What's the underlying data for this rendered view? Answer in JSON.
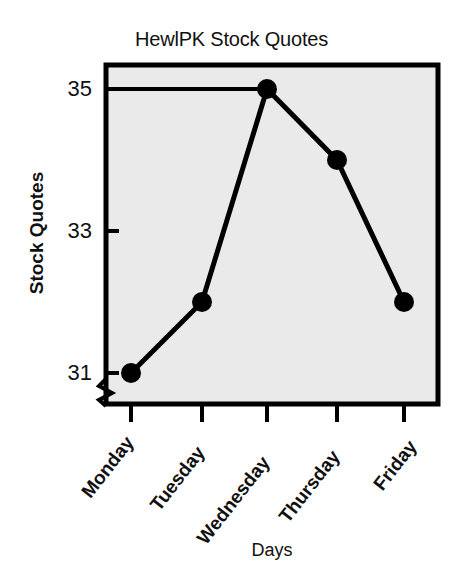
{
  "chart_data": {
    "type": "line",
    "title": "HewlPK Stock Quotes",
    "xlabel": "Days",
    "ylabel": "Stock Quotes",
    "categories": [
      "Monday",
      "Tuesday",
      "Wednesday",
      "Thursday",
      "Friday"
    ],
    "values": [
      31,
      32,
      35,
      34,
      32
    ],
    "series": [
      {
        "name": "Stock Quotes",
        "values": [
          31,
          32,
          35,
          34,
          32
        ]
      }
    ],
    "ytick_labels": [
      "35",
      "33",
      "31"
    ],
    "ytick_values": [
      35,
      33,
      31
    ],
    "ylim": [
      30.6,
      35.35
    ],
    "grid": false,
    "legend": false,
    "axis_break": true,
    "axis_break_axis": "y",
    "marker": "filled-circle",
    "reference_line": {
      "from_axis_value": 35,
      "to_category": "Wednesday"
    },
    "colors": {
      "line": "#000000",
      "marker": "#000000",
      "plot_background": "#eaeaea",
      "axis": "#000000",
      "text": "#111111",
      "figure_background": "#ffffff"
    }
  }
}
